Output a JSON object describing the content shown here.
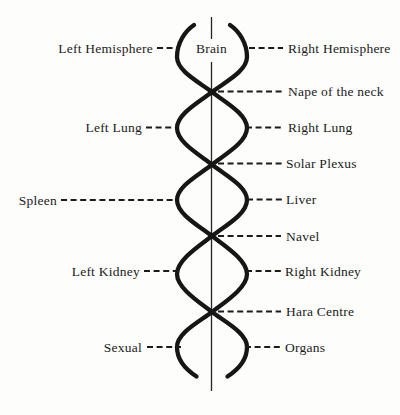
{
  "colors": {
    "ink": "#161616",
    "paper": "#fdfdfb"
  },
  "levels": [
    {
      "left": "Left Hemisphere",
      "center": "Brain",
      "right": "Right Hemisphere"
    },
    {
      "right": "Nape of the neck"
    },
    {
      "left": "Left Lung",
      "right": "Right Lung"
    },
    {
      "right": "Solar Plexus"
    },
    {
      "left": "Spleen",
      "right": "Liver"
    },
    {
      "right": "Navel"
    },
    {
      "left": "Left Kidney",
      "right": "Right Kidney"
    },
    {
      "right": "Hara Centre"
    },
    {
      "left": "Sexual",
      "right": "Organs"
    }
  ]
}
